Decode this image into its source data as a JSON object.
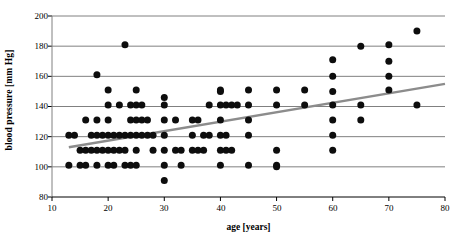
{
  "chart_data": {
    "type": "scatter",
    "title": "",
    "xlabel": "age [years]",
    "ylabel": "blood pressure [mm Hg]",
    "xlim": [
      10,
      80
    ],
    "ylim": [
      80,
      200
    ],
    "xticks": [
      10,
      20,
      30,
      40,
      50,
      60,
      70,
      80
    ],
    "yticks": [
      80,
      100,
      120,
      140,
      160,
      180,
      200
    ],
    "grid": "horizontal",
    "legend": "none",
    "marker": {
      "shape": "circle",
      "color": "#0d0d0d",
      "size": 4.6
    },
    "points": [
      [
        13,
        121
      ],
      [
        13,
        101
      ],
      [
        14,
        121
      ],
      [
        15,
        111
      ],
      [
        15,
        101
      ],
      [
        16,
        131
      ],
      [
        16,
        111
      ],
      [
        16,
        101
      ],
      [
        17,
        121
      ],
      [
        17,
        111
      ],
      [
        18,
        161
      ],
      [
        18,
        131
      ],
      [
        18,
        121
      ],
      [
        18,
        111
      ],
      [
        18,
        101
      ],
      [
        19,
        121
      ],
      [
        19,
        111
      ],
      [
        20,
        151
      ],
      [
        20,
        141
      ],
      [
        20,
        131
      ],
      [
        20,
        121
      ],
      [
        20,
        111
      ],
      [
        20,
        101
      ],
      [
        21,
        121
      ],
      [
        21,
        111
      ],
      [
        21,
        101
      ],
      [
        22,
        141
      ],
      [
        22,
        121
      ],
      [
        22,
        111
      ],
      [
        23,
        181
      ],
      [
        23,
        121
      ],
      [
        23,
        111
      ],
      [
        23,
        101
      ],
      [
        24,
        141
      ],
      [
        24,
        131
      ],
      [
        24,
        121
      ],
      [
        24,
        101
      ],
      [
        25,
        151
      ],
      [
        25,
        141
      ],
      [
        25,
        131
      ],
      [
        25,
        121
      ],
      [
        25,
        111
      ],
      [
        25,
        101
      ],
      [
        26,
        141
      ],
      [
        26,
        131
      ],
      [
        26,
        121
      ],
      [
        27,
        131
      ],
      [
        27,
        121
      ],
      [
        28,
        121
      ],
      [
        28,
        111
      ],
      [
        30,
        146
      ],
      [
        30,
        141
      ],
      [
        30,
        131
      ],
      [
        30,
        121
      ],
      [
        30,
        111
      ],
      [
        30,
        101
      ],
      [
        30,
        91
      ],
      [
        32,
        131
      ],
      [
        32,
        111
      ],
      [
        33,
        111
      ],
      [
        33,
        101
      ],
      [
        35,
        131
      ],
      [
        35,
        121
      ],
      [
        35,
        111
      ],
      [
        36,
        131
      ],
      [
        36,
        111
      ],
      [
        37,
        121
      ],
      [
        37,
        111
      ],
      [
        38,
        141
      ],
      [
        38,
        121
      ],
      [
        40,
        151
      ],
      [
        40,
        150
      ],
      [
        40,
        141
      ],
      [
        40,
        131
      ],
      [
        40,
        121
      ],
      [
        40,
        111
      ],
      [
        40,
        101
      ],
      [
        41,
        141
      ],
      [
        41,
        121
      ],
      [
        41,
        111
      ],
      [
        42,
        141
      ],
      [
        42,
        111
      ],
      [
        43,
        141
      ],
      [
        45,
        151
      ],
      [
        45,
        141
      ],
      [
        45,
        131
      ],
      [
        45,
        121
      ],
      [
        45,
        101
      ],
      [
        50,
        151
      ],
      [
        50,
        141
      ],
      [
        50,
        111
      ],
      [
        50,
        101
      ],
      [
        50,
        100
      ],
      [
        55,
        151
      ],
      [
        55,
        141
      ],
      [
        60,
        171
      ],
      [
        60,
        160
      ],
      [
        60,
        150
      ],
      [
        60,
        141
      ],
      [
        60,
        131
      ],
      [
        60,
        121
      ],
      [
        60,
        111
      ],
      [
        65,
        180
      ],
      [
        65,
        141
      ],
      [
        65,
        131
      ],
      [
        70,
        181
      ],
      [
        70,
        170
      ],
      [
        70,
        160
      ],
      [
        70,
        151
      ],
      [
        75,
        190
      ],
      [
        75,
        141
      ]
    ],
    "trendline": {
      "type": "linear",
      "color": "#8c8c8c",
      "width": 2.4,
      "x0": 13,
      "y0": 113,
      "x1": 80,
      "y1": 155
    },
    "axis_color": "#000000",
    "grid_color": "#808080"
  }
}
